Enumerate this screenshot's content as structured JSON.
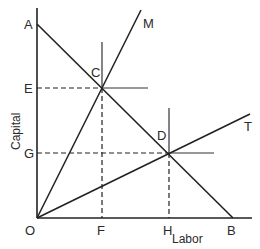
{
  "diagram": {
    "axes": {
      "x_label": "Labor",
      "y_label": "Capital"
    },
    "points": {
      "origin": "O",
      "A": "A",
      "B": "B",
      "C": "C",
      "D": "D",
      "E": "E",
      "F": "F",
      "G": "G",
      "H": "H"
    },
    "lines": {
      "M": "M",
      "T": "T"
    }
  }
}
